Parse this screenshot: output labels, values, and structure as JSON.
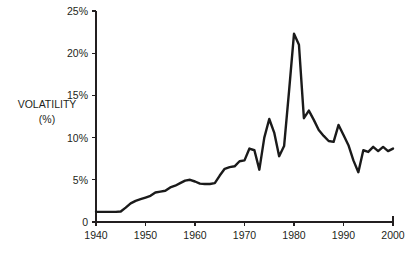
{
  "chart_data": {
    "type": "line",
    "title": "",
    "xlabel": "",
    "ylabel": "VOLATILITY\n(%)",
    "ylabel_line1": "VOLATILITY",
    "ylabel_line2": "(%)",
    "xlim": [
      1940,
      2000
    ],
    "ylim": [
      0,
      25
    ],
    "grid": false,
    "legend": false,
    "x_ticks": [
      1940,
      1950,
      1960,
      1970,
      1980,
      1990,
      2000
    ],
    "x_tick_labels": [
      "1940",
      "1950",
      "1960",
      "1970",
      "1980",
      "1990",
      "2000"
    ],
    "y_ticks": [
      0,
      5,
      10,
      15,
      20,
      25
    ],
    "y_tick_labels": [
      "0",
      "5%",
      "10%",
      "15%",
      "20%",
      "25%"
    ],
    "series": [
      {
        "name": "Volatility",
        "color": "#1a1a1a",
        "x": [
          1940,
          1941,
          1942,
          1943,
          1944,
          1945,
          1946,
          1947,
          1948,
          1949,
          1950,
          1951,
          1952,
          1953,
          1954,
          1955,
          1956,
          1957,
          1958,
          1959,
          1960,
          1961,
          1962,
          1963,
          1964,
          1965,
          1966,
          1967,
          1968,
          1969,
          1970,
          1971,
          1972,
          1973,
          1974,
          1975,
          1976,
          1977,
          1978,
          1979,
          1980,
          1981,
          1982,
          1983,
          1984,
          1985,
          1986,
          1987,
          1988,
          1989,
          1990,
          1991,
          1992,
          1993,
          1994,
          1995,
          1996,
          1997,
          1998,
          1999,
          2000
        ],
        "values": [
          1.2,
          1.2,
          1.2,
          1.2,
          1.2,
          1.25,
          1.7,
          2.2,
          2.5,
          2.7,
          2.9,
          3.1,
          3.5,
          3.6,
          3.7,
          4.1,
          4.3,
          4.6,
          4.9,
          5.0,
          4.8,
          4.55,
          4.5,
          4.5,
          4.6,
          5.5,
          6.3,
          6.5,
          6.6,
          7.2,
          7.3,
          8.7,
          8.5,
          6.2,
          10.0,
          12.2,
          10.6,
          7.8,
          9.0,
          15.5,
          22.3,
          21.0,
          12.3,
          13.2,
          12.1,
          10.9,
          10.2,
          9.6,
          9.5,
          11.5,
          10.3,
          9.1,
          7.3,
          5.9,
          8.5,
          8.3,
          8.9,
          8.4,
          8.9,
          8.4,
          8.7
        ]
      }
    ]
  },
  "annotations": {
    "axis_label_top": "VOLATILITY",
    "axis_label_bottom": "(%)"
  },
  "colors": {
    "line": "#1a1a1a",
    "axis": "#231f20",
    "background": "#ffffff",
    "text": "#231f20"
  }
}
